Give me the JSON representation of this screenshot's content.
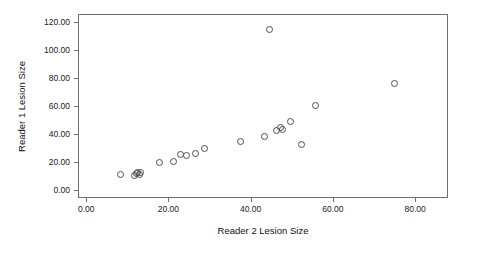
{
  "chart_data": {
    "type": "scatter",
    "title": "",
    "xlabel": "Reader 2 Lesion Size",
    "ylabel": "Reader 1 Lesion Size",
    "xlim": [
      -2.0,
      88.0
    ],
    "ylim": [
      -6.0,
      126.0
    ],
    "xticks": [
      0.0,
      20.0,
      40.0,
      60.0,
      80.0
    ],
    "xtick_labels": [
      "0.00",
      "20.00",
      "40.00",
      "60.00",
      "80.00"
    ],
    "yticks": [
      0.0,
      20.0,
      40.0,
      60.0,
      80.0,
      100.0,
      120.0
    ],
    "ytick_labels": [
      "0.00",
      "20.00",
      "40.00",
      "60.00",
      "80.00",
      "100.00",
      "120.00"
    ],
    "grid": false,
    "legend": false,
    "marker": "open-circle",
    "marker_color": "#4d4d4d",
    "points": [
      {
        "x": 8.2,
        "y": 11.6
      },
      {
        "x": 11.6,
        "y": 11.2
      },
      {
        "x": 12.0,
        "y": 12.4
      },
      {
        "x": 12.3,
        "y": 12.9
      },
      {
        "x": 12.6,
        "y": 11.9
      },
      {
        "x": 13.0,
        "y": 13.0
      },
      {
        "x": 17.6,
        "y": 20.2
      },
      {
        "x": 20.9,
        "y": 20.8
      },
      {
        "x": 22.8,
        "y": 26.1
      },
      {
        "x": 24.1,
        "y": 25.3
      },
      {
        "x": 26.3,
        "y": 26.4
      },
      {
        "x": 28.6,
        "y": 30.0
      },
      {
        "x": 37.2,
        "y": 35.4
      },
      {
        "x": 43.0,
        "y": 38.7
      },
      {
        "x": 44.4,
        "y": 115.6
      },
      {
        "x": 46.0,
        "y": 43.3
      },
      {
        "x": 47.0,
        "y": 45.1
      },
      {
        "x": 47.6,
        "y": 44.0
      },
      {
        "x": 49.5,
        "y": 49.4
      },
      {
        "x": 52.0,
        "y": 33.3
      },
      {
        "x": 55.5,
        "y": 61.0
      },
      {
        "x": 74.7,
        "y": 77.2
      }
    ]
  }
}
